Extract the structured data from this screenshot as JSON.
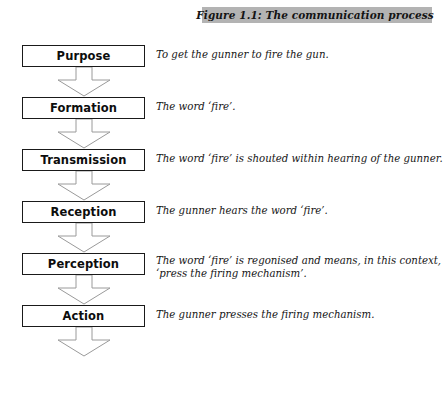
{
  "figure": {
    "caption": "Figure 1.1: The communication process",
    "caption_bar_color": "#b3b3b3",
    "box_border_color": "#1a1a1a",
    "arrow_outline_color": "#9a9a9a",
    "arrow_fill_color": "#ffffff"
  },
  "stages": [
    {
      "label": "Purpose",
      "description_lines": [
        "To get the gunner to fire the gun."
      ]
    },
    {
      "label": "Formation",
      "description_lines": [
        "The word ‘fire’."
      ]
    },
    {
      "label": "Transmission",
      "description_lines": [
        "The word ‘fire’ is shouted within hearing of the gunner."
      ]
    },
    {
      "label": "Reception",
      "description_lines": [
        "The gunner hears the word ‘fire’."
      ]
    },
    {
      "label": "Perception",
      "description_lines": [
        "The word ‘fire’ is regonised and means, in this context,",
        "‘press the firing mechanism’."
      ]
    },
    {
      "label": "Action",
      "description_lines": [
        "The gunner presses the firing mechanism."
      ]
    }
  ]
}
